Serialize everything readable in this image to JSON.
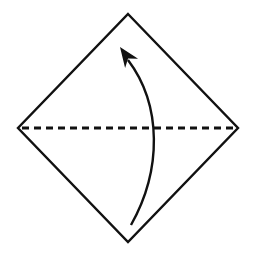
{
  "diagram": {
    "kind": "origami-fold-step",
    "background_color": "#ffffff",
    "line_color": "#111111",
    "elements": {
      "paper": "diamond-square-outline",
      "fold_line": "horizontal-dashed-valley-fold-line",
      "arrow": "curved-fold-up-arrow"
    }
  }
}
